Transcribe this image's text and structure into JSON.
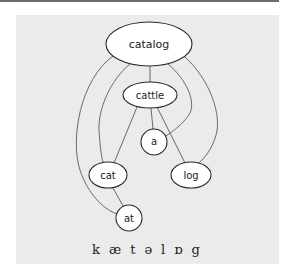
{
  "diagram": {
    "type": "word-segmentation-lattice",
    "nodes": [
      {
        "id": "catalog",
        "label": "catalog",
        "shape": "ellipse",
        "cx": 149,
        "cy": 44,
        "rx": 43,
        "ry": 22
      },
      {
        "id": "cattle",
        "label": "cattle",
        "shape": "ellipse",
        "cx": 150,
        "cy": 95,
        "rx": 27,
        "ry": 13
      },
      {
        "id": "a",
        "label": "a",
        "shape": "circle",
        "cx": 154,
        "cy": 142,
        "rx": 13,
        "ry": 13
      },
      {
        "id": "cat",
        "label": "cat",
        "shape": "ellipse",
        "cx": 108,
        "cy": 175,
        "rx": 19,
        "ry": 13
      },
      {
        "id": "log",
        "label": "log",
        "shape": "ellipse",
        "cx": 191,
        "cy": 175,
        "rx": 20,
        "ry": 13
      },
      {
        "id": "at",
        "label": "at",
        "shape": "circle",
        "cx": 129,
        "cy": 218,
        "rx": 13,
        "ry": 13
      }
    ],
    "edges": [
      {
        "from": "catalog",
        "to": "cattle",
        "style": "straight"
      },
      {
        "from": "catalog",
        "to": "at",
        "style": "curve-left-outer"
      },
      {
        "from": "catalog",
        "to": "cat",
        "style": "curve-left-inner"
      },
      {
        "from": "catalog",
        "to": "log",
        "style": "curve-right-outer"
      },
      {
        "from": "catalog",
        "to": "a",
        "style": "curve-right-inner"
      },
      {
        "from": "cattle",
        "to": "cat",
        "style": "straight"
      },
      {
        "from": "cattle",
        "to": "a",
        "style": "straight"
      },
      {
        "from": "cattle",
        "to": "log",
        "style": "straight"
      },
      {
        "from": "cat",
        "to": "at",
        "style": "straight"
      }
    ]
  },
  "phonetic": {
    "segments": [
      "k",
      "æ",
      "t",
      "ə",
      "l",
      "ɒ",
      "g"
    ]
  },
  "colors": {
    "panel_background": "#ebebeb",
    "node_fill": "#ffffff",
    "node_stroke": "#2a2a2a",
    "edge_stroke": "#5a5a5a",
    "top_rule": "#6e6e6e"
  }
}
